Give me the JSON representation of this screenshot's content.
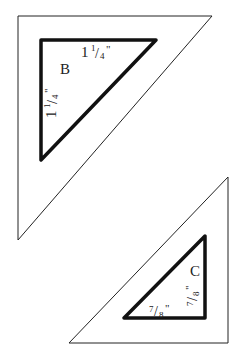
{
  "diagram": {
    "type": "quilt-template-triangles",
    "pieces": [
      {
        "id": "B",
        "letter": "B",
        "side_top": "1 1/4\"",
        "side_left": "1 1/4\"",
        "top_whole": "1",
        "top_num": "1",
        "top_den": "4",
        "left_whole": "1",
        "left_num": "1",
        "left_den": "4",
        "quote": "\""
      },
      {
        "id": "C",
        "letter": "C",
        "side_bottom": "7/8\"",
        "side_right": "7/8\"",
        "bottom_num": "7",
        "bottom_den": "8",
        "right_num": "7",
        "right_den": "8",
        "quote": "\""
      }
    ],
    "colors": {
      "outline": "#111111",
      "background": "#ffffff"
    }
  }
}
